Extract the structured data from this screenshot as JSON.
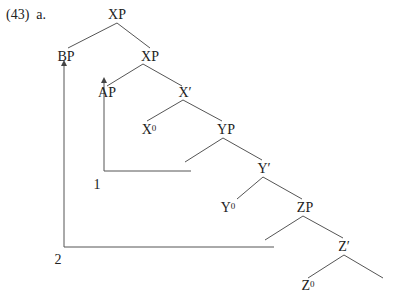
{
  "example": {
    "number": "(43)",
    "sub": "a."
  },
  "nodes": {
    "xp_root": "XP",
    "bp": "BP",
    "xp": "XP",
    "ap": "AP",
    "xbar": "X′",
    "x0": "X",
    "yp": "YP",
    "ybar": "Y′",
    "y0": "Y",
    "zp": "ZP",
    "zbar": "Z′",
    "z0": "Z",
    "zero_sup": "0"
  },
  "movement_indices": {
    "first": "1",
    "second": "2"
  },
  "colors": {
    "line": "#444444",
    "text": "#222222"
  }
}
